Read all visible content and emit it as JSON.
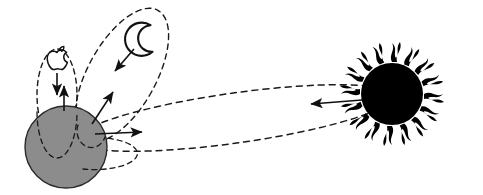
{
  "figure": {
    "background_color": "#ffffff"
  },
  "colors": {
    "earth_fill": "#8c8c8c",
    "earth_stroke": "#1a1a1a",
    "sun_fill": "#000000",
    "line_color": "#1a1a1a",
    "dash_color": "#1a1a1a",
    "background": "#ffffff"
  },
  "bodies": {
    "earth": {
      "name": "Earth",
      "shape": "circle",
      "cx": 66,
      "cy": 147,
      "r": 41,
      "fill": "#8c8c8c"
    },
    "sun": {
      "name": "Sun",
      "shape": "circle-with-wavy-rays",
      "cx": 392,
      "cy": 94,
      "r": 31,
      "fill": "#000000",
      "ray_count": 16
    },
    "moon": {
      "name": "Moon",
      "shape": "crescent",
      "cx": 142,
      "cy": 38,
      "r": 15
    },
    "apple": {
      "name": "Apple",
      "shape": "apple-with-bite-and-leaf",
      "cx": 57,
      "cy": 62,
      "r": 11
    }
  },
  "orbits": [
    {
      "id": "apple-orbit",
      "label": "Apple orbit (small vertical dashed ellipse)",
      "cx": 57,
      "cy": 95,
      "rx": 20,
      "ry": 46,
      "rotation": 0,
      "style": "dashed"
    },
    {
      "id": "moon-orbit",
      "label": "Moon orbit (tilted dashed ellipse)",
      "cx": 122,
      "cy": 75,
      "rx": 34,
      "ry": 74,
      "rotation": 29,
      "style": "dashed"
    },
    {
      "id": "earth-sun-orbit",
      "label": "Earth-Sun orbit (long dashed ellipse)",
      "cx": 235,
      "cy": 118,
      "rx": 160,
      "ry": 25,
      "rotation": -8,
      "style": "dashed"
    }
  ],
  "arrows": [
    {
      "id": "apple-falls",
      "label": "Apple falls toward Earth",
      "x1": 57,
      "y1": 73,
      "x2": 57,
      "y2": 96,
      "direction": "down"
    },
    {
      "id": "earth-pulls-apple",
      "label": "Earth pulls up on apple",
      "x1": 63,
      "y1": 110,
      "x2": 63,
      "y2": 87,
      "direction": "up"
    },
    {
      "id": "moon-to-earth",
      "label": "Moon accelerates toward Earth",
      "x1": 133,
      "y1": 48,
      "x2": 114,
      "y2": 71,
      "direction": "down-left"
    },
    {
      "id": "earth-to-moon",
      "label": "Earth attracts Moon",
      "x1": 93,
      "y1": 123,
      "x2": 112,
      "y2": 92,
      "direction": "up-right"
    },
    {
      "id": "earth-to-sun",
      "label": "Earth attracted toward Sun",
      "x1": 96,
      "y1": 133,
      "x2": 140,
      "y2": 131,
      "direction": "right"
    },
    {
      "id": "sun-to-earth",
      "label": "Sun attracts Earth",
      "x1": 360,
      "y1": 101,
      "x2": 312,
      "y2": 104,
      "direction": "left"
    }
  ]
}
